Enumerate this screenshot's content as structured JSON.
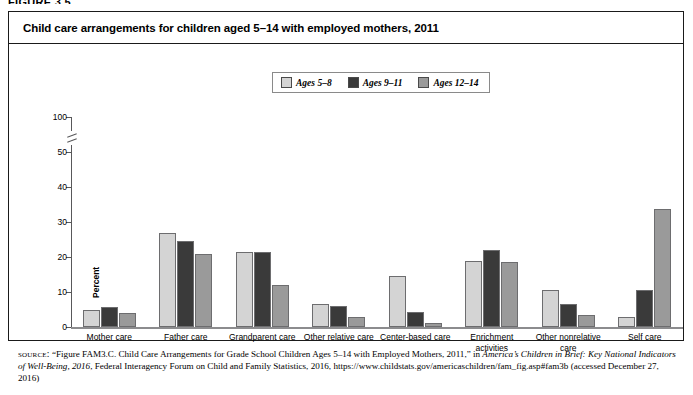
{
  "figure": {
    "label": "FIGURE 3.5"
  },
  "title": "Child care arrangements for children aged 5–14 with employed mothers, 2011",
  "legend": {
    "entries": [
      {
        "label": "Ages 5–8",
        "color": "#d4d4d4"
      },
      {
        "label": "Ages 9–11",
        "color": "#3a3a3a"
      },
      {
        "label": "Ages 12–14",
        "color": "#9a9a9a"
      }
    ]
  },
  "axis": {
    "ylabel": "Percent",
    "yticks": [
      "0",
      "10",
      "20",
      "30",
      "40",
      "50",
      "100"
    ],
    "break_note": "axis-break-between-50-and-100"
  },
  "source": {
    "label": "source:",
    "text_1": " “Figure FAM3.C. Child Care Arrangements for Grade School Children Ages 5–14 with Employed Mothers, 2011,” in ",
    "italic_1": "America’s Children in Brief: Key National Indicators of Well-Being, 2016",
    "text_2": ", Federal Interagency Forum on Child and Family Statistics, 2016, https://www.childstats.gov/americaschildren/fam_fig.asp#fam3b (accessed December 27, 2016)"
  },
  "chart_data": {
    "type": "bar",
    "title": "Child care arrangements for children aged 5–14 with employed mothers, 2011",
    "xlabel": "",
    "ylabel": "Percent",
    "ylim": [
      0,
      50
    ],
    "ytick_values": [
      0,
      10,
      20,
      30,
      40,
      50,
      100
    ],
    "axis_break": true,
    "grid": false,
    "legend_position": "top-center",
    "categories": [
      "Mother care",
      "Father care",
      "Grandparent care",
      "Other relative care",
      "Center-based care",
      "Enrichment activities",
      "Other nonrelative care",
      "Self care"
    ],
    "series": [
      {
        "name": "Ages 5–8",
        "color": "#d4d4d4",
        "values": [
          5.0,
          27.0,
          21.5,
          6.5,
          14.5,
          19.0,
          10.5,
          3.0
        ]
      },
      {
        "name": "Ages 9–11",
        "color": "#3a3a3a",
        "values": [
          5.8,
          24.5,
          21.5,
          6.0,
          4.2,
          22.0,
          6.5,
          10.5
        ]
      },
      {
        "name": "Ages 12–14",
        "color": "#9a9a9a",
        "values": [
          4.0,
          21.0,
          12.0,
          3.0,
          1.2,
          18.5,
          3.5,
          33.8
        ]
      }
    ]
  }
}
